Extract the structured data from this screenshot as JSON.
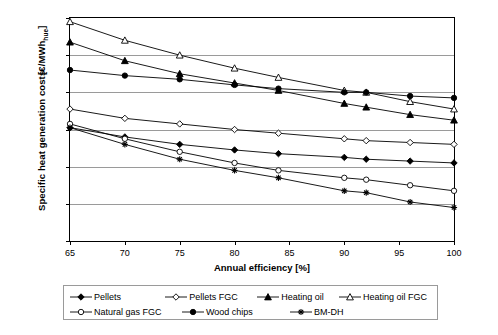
{
  "chart_data": {
    "type": "line",
    "title": "",
    "xlabel": "Annual efficiency [%]",
    "ylabel": "Specific heat generation costs [€/MWhhue]",
    "ylabel_unit_main": "Specific heat generation costs",
    "ylabel_unit_sub": "[€/MWh",
    "ylabel_unit_sub_small": "hue",
    "ylabel_unit_sub_end": "]",
    "xlim": [
      65,
      100
    ],
    "ylim": [
      100,
      220
    ],
    "xticks": [
      65,
      70,
      75,
      80,
      85,
      90,
      95,
      100
    ],
    "yticks": [
      100,
      120,
      140,
      160,
      180,
      200,
      220
    ],
    "grid": "horizontal",
    "legend_position": "bottom",
    "x": [
      65,
      70,
      75,
      80,
      84,
      90,
      92,
      96,
      100
    ],
    "series": [
      {
        "name": "Pellets",
        "marker": "filled-diamond",
        "values": [
          161,
          156,
          152,
          149,
          147,
          145,
          144,
          143,
          142
        ]
      },
      {
        "name": "Pellets FGC",
        "marker": "open-diamond",
        "values": [
          171,
          166,
          163,
          160,
          158,
          155,
          154,
          153,
          152
        ]
      },
      {
        "name": "Heating oil",
        "marker": "filled-triangle",
        "values": [
          207,
          197,
          190,
          185,
          181,
          174,
          172,
          168,
          165
        ]
      },
      {
        "name": "Heating oil FGC",
        "marker": "open-triangle",
        "values": [
          218,
          208,
          200,
          193,
          188,
          181,
          180,
          175,
          171
        ]
      },
      {
        "name": "Natural gas FGC",
        "marker": "open-circle",
        "values": [
          163,
          155,
          148,
          142,
          138,
          134,
          133,
          130,
          127
        ]
      },
      {
        "name": "Wood chips",
        "marker": "filled-circle",
        "values": [
          192,
          189,
          187,
          184,
          182,
          180,
          180,
          178,
          177
        ]
      },
      {
        "name": "BM-DH",
        "marker": "asterisk",
        "values": [
          161,
          152,
          144,
          138,
          134,
          127,
          126,
          121,
          118
        ]
      }
    ]
  },
  "legend": {
    "items": [
      {
        "label": "Pellets",
        "marker": "filled-diamond"
      },
      {
        "label": "Pellets FGC",
        "marker": "open-diamond"
      },
      {
        "label": "Heating oil",
        "marker": "filled-triangle"
      },
      {
        "label": "Heating oil FGC",
        "marker": "open-triangle"
      },
      {
        "label": "Natural gas FGC",
        "marker": "open-circle"
      },
      {
        "label": "Wood chips",
        "marker": "filled-circle"
      },
      {
        "label": "BM-DH",
        "marker": "asterisk"
      }
    ]
  },
  "colors": {
    "line": "#000000",
    "grid": "#9a9a9a",
    "axis": "#000000",
    "background": "#ffffff"
  }
}
